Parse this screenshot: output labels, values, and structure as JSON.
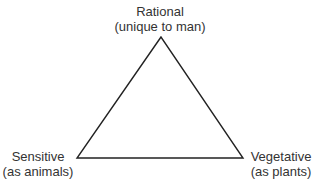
{
  "diagram": {
    "type": "triangle",
    "stroke_color": "#222222",
    "vertices": {
      "top": {
        "title": "Rational",
        "subtitle": "(unique to man)"
      },
      "bottom_left": {
        "title": "Sensitive",
        "subtitle": "(as animals)"
      },
      "bottom_right": {
        "title": "Vegetative",
        "subtitle": "(as plants)"
      }
    }
  }
}
